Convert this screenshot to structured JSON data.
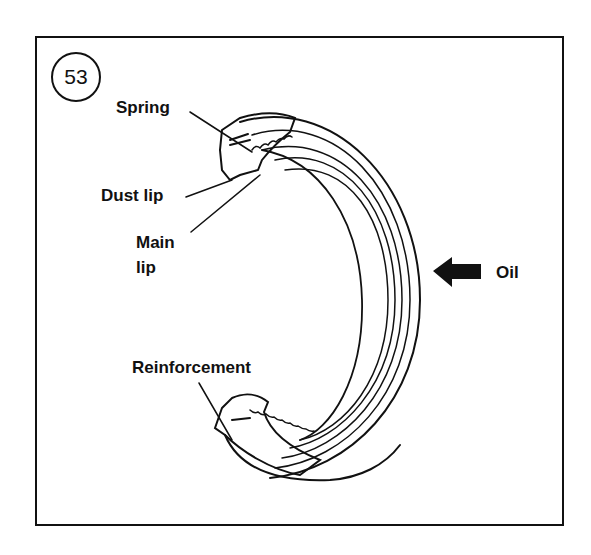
{
  "figure": {
    "number": "53",
    "labels": {
      "spring": "Spring",
      "dust_lip": "Dust lip",
      "main_lip_line1": "Main",
      "main_lip_line2": "lip",
      "reinforcement": "Reinforcement",
      "oil": "Oil"
    },
    "colors": {
      "ink": "#111111",
      "background": "#ffffff"
    }
  }
}
